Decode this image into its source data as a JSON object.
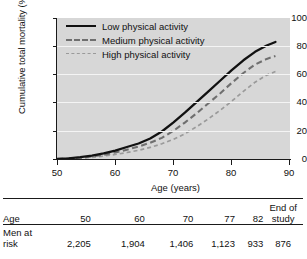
{
  "chart_data": {
    "type": "line",
    "title": "",
    "xlabel": "Age (years)",
    "ylabel": "Cumulative total mortality (%)",
    "xlim": [
      50,
      90
    ],
    "ylim": [
      0,
      100
    ],
    "xticks": [
      50,
      60,
      70,
      80,
      90
    ],
    "yticks": [
      0,
      20,
      40,
      60,
      80,
      100
    ],
    "grid": "horizontal-white-on-gray",
    "legend_position": "top-left-inside",
    "series": [
      {
        "name": "Low physical activity",
        "style": "solid",
        "color": "#111111",
        "x": [
          50,
          52,
          54,
          56,
          58,
          60,
          62,
          64,
          66,
          68,
          70,
          72,
          74,
          76,
          78,
          80,
          82,
          84,
          86,
          87.5
        ],
        "values": [
          0,
          0.5,
          1.3,
          2.4,
          4.0,
          6.0,
          8.5,
          11.0,
          14.5,
          19.5,
          26.0,
          33.0,
          40.5,
          48.0,
          55.5,
          63.0,
          70.0,
          76.0,
          80.5,
          83.0
        ]
      },
      {
        "name": "Medium physical activity",
        "style": "dashed",
        "color": "#6f6f6f",
        "x": [
          50,
          52,
          54,
          56,
          58,
          60,
          62,
          64,
          66,
          68,
          70,
          72,
          74,
          76,
          78,
          80,
          82,
          84,
          86,
          87.5
        ],
        "values": [
          0,
          0.3,
          0.9,
          1.8,
          3.0,
          4.6,
          6.6,
          8.8,
          11.5,
          15.0,
          20.0,
          26.0,
          32.5,
          39.5,
          46.5,
          54.0,
          61.0,
          67.0,
          71.0,
          73.0
        ]
      },
      {
        "name": "High physical activity",
        "style": "fine-dashed",
        "color": "#9a9a9a",
        "x": [
          50,
          52,
          54,
          56,
          58,
          60,
          62,
          64,
          66,
          68,
          70,
          72,
          74,
          76,
          78,
          80,
          82,
          84,
          86,
          87.5
        ],
        "values": [
          0,
          0.2,
          0.6,
          1.2,
          2.1,
          3.2,
          4.6,
          6.2,
          8.2,
          10.8,
          14.0,
          18.0,
          23.0,
          28.5,
          34.5,
          41.0,
          48.0,
          54.5,
          59.5,
          62.0
        ]
      }
    ]
  },
  "chart": {
    "y_axis_title": "Cumulative total mortality (%)",
    "x_axis_title": "Age (years)",
    "y_tick_labels": [
      "100",
      "80",
      "60",
      "40",
      "20",
      "0"
    ],
    "x_tick_labels": [
      "50",
      "60",
      "70",
      "80",
      "90"
    ],
    "legend": [
      {
        "label": "Low physical activity"
      },
      {
        "label": "Medium physical activity"
      },
      {
        "label": "High physical activity"
      }
    ]
  },
  "risk_table": {
    "row_headers": [
      "Age",
      "Men at risk"
    ],
    "age_row_label": "Age",
    "men_row_label_line1": "Men at",
    "men_row_label_line2": "risk",
    "columns": [
      {
        "age": "50",
        "end_of_study": false,
        "at_risk": "2,205"
      },
      {
        "age": "60",
        "end_of_study": false,
        "at_risk": "1,904"
      },
      {
        "age": "70",
        "end_of_study": false,
        "at_risk": "1,406"
      },
      {
        "age": "77",
        "end_of_study": false,
        "at_risk": "1,123"
      },
      {
        "age": "82",
        "end_of_study": false,
        "at_risk": "933"
      },
      {
        "age_line1": "End of",
        "age_line2": "study",
        "end_of_study": true,
        "at_risk": "876"
      }
    ]
  }
}
